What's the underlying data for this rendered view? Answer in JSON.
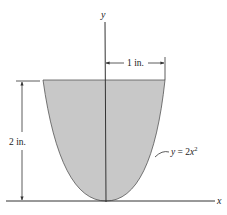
{
  "diagram": {
    "axes": {
      "x_label": "x",
      "y_label": "y"
    },
    "dimensions": {
      "width_label": "1 in.",
      "height_label": "2 in."
    },
    "curve": {
      "equation_prefix": "y = 2",
      "equation_var": "x",
      "equation_exp": "2"
    },
    "colors": {
      "fill": "#c8c8c8",
      "stroke": "#333333",
      "background": "#ffffff"
    }
  }
}
